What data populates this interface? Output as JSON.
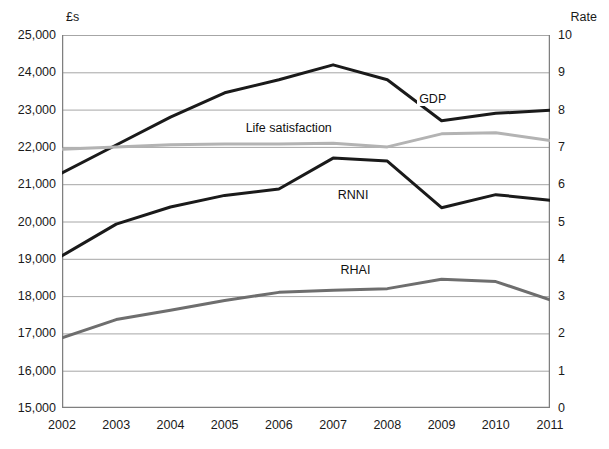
{
  "chart_data": {
    "type": "line",
    "title": "",
    "xlabel": "",
    "ylabel": "£s",
    "y2label": "Rate",
    "grid": true,
    "legend_position": "inline-annotations",
    "categories": [
      "2002",
      "2003",
      "2004",
      "2005",
      "2006",
      "2007",
      "2008",
      "2009",
      "2010",
      "2011"
    ],
    "x_tick_labels": [
      "2002",
      "2003",
      "2004",
      "2005",
      "2006",
      "2007",
      "2008",
      "2009",
      "2010",
      "2011"
    ],
    "ylim": [
      15000,
      25000
    ],
    "y_tick_labels": [
      "15,000",
      "16,000",
      "17,000",
      "18,000",
      "19,000",
      "20,000",
      "21,000",
      "22,000",
      "23,000",
      "24,000",
      "25,000"
    ],
    "y_tick_values": [
      15000,
      16000,
      17000,
      18000,
      19000,
      20000,
      21000,
      22000,
      23000,
      24000,
      25000
    ],
    "y2lim": [
      0,
      10
    ],
    "y2_tick_labels": [
      "0",
      "1",
      "2",
      "3",
      "4",
      "5",
      "6",
      "7",
      "8",
      "9",
      "10"
    ],
    "y2_tick_values": [
      0,
      1,
      2,
      3,
      4,
      5,
      6,
      7,
      8,
      9,
      10
    ],
    "series": [
      {
        "name": "GDP",
        "axis": "left",
        "color": "#1a1a1a",
        "width": 3,
        "label_x": 2008.55,
        "label_y": 23250,
        "values": [
          21300,
          22050,
          22800,
          23450,
          23800,
          24200,
          23800,
          22700,
          22900,
          22980
        ]
      },
      {
        "name": "Life satisfaction",
        "axis": "left",
        "color": "#b3b3b3",
        "width": 3,
        "label_x": 2005.35,
        "label_y": 22470,
        "values": [
          21940,
          22000,
          22060,
          22080,
          22080,
          22100,
          22000,
          22350,
          22380,
          22170
        ]
      },
      {
        "name": "RNNI",
        "axis": "left",
        "color": "#1a1a1a",
        "width": 3,
        "label_x": 2007.05,
        "label_y": 20680,
        "values": [
          19080,
          19930,
          20390,
          20700,
          20870,
          21700,
          21620,
          20370,
          20720,
          20570
        ]
      },
      {
        "name": "RHAI",
        "axis": "left",
        "color": "#6e6e6e",
        "width": 3,
        "label_x": 2007.1,
        "label_y": 18680,
        "values": [
          16880,
          17370,
          17620,
          17880,
          18100,
          18160,
          18200,
          18450,
          18390,
          17900
        ]
      }
    ]
  }
}
